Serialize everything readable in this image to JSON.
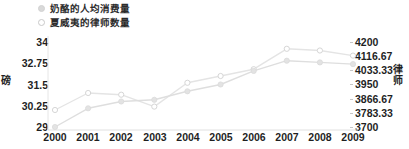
{
  "legend": {
    "items": [
      {
        "label": "奶酪的人均消费量",
        "marker": "filled-circle-icon",
        "color": "#d9d9d9"
      },
      {
        "label": "夏威夷的律师数量",
        "marker": "hollow-circle-icon",
        "color": "#c9c9c9"
      }
    ]
  },
  "axes": {
    "left_title": "磅",
    "right_title": "律师",
    "left_ticks": [
      "34",
      "32.75",
      "31.5",
      "30.25",
      "29"
    ],
    "right_ticks": [
      "4200",
      "4116.67",
      "4033.33",
      "3950",
      "3866.67",
      "3783.33",
      "3700"
    ],
    "x_ticks": [
      "2000",
      "2001",
      "2002",
      "2003",
      "2004",
      "2005",
      "2006",
      "2007",
      "2008",
      "2009"
    ]
  },
  "chart_data": {
    "type": "line",
    "title": "",
    "xlabel": "",
    "ylabel": "磅",
    "y2label": "律师",
    "x": [
      2000,
      2001,
      2002,
      2003,
      2004,
      2005,
      2006,
      2007,
      2008,
      2009
    ],
    "categories": [
      "2000",
      "2001",
      "2002",
      "2003",
      "2004",
      "2005",
      "2006",
      "2007",
      "2008",
      "2009"
    ],
    "grid": false,
    "legend_position": "top-left",
    "series": [
      {
        "name": "奶酪的人均消费量",
        "axis": "left",
        "unit": "磅",
        "color": "#dcdcdc",
        "marker": "filled-circle",
        "values": [
          29.0,
          30.1,
          30.5,
          30.6,
          31.1,
          31.5,
          32.3,
          32.9,
          32.8,
          32.7
        ],
        "ylim": [
          29,
          34
        ],
        "yticks": [
          29,
          30.25,
          31.5,
          32.75,
          34
        ]
      },
      {
        "name": "夏威夷的律师数量",
        "axis": "right",
        "unit": "律师",
        "color": "#e2e2e2",
        "marker": "hollow-circle",
        "values": [
          3800,
          3900,
          3890,
          3820,
          3960,
          4000,
          4040,
          4160,
          4150,
          4120
        ],
        "ylim": [
          3700,
          4200
        ],
        "yticks": [
          3700,
          3783.33,
          3866.67,
          3950,
          4033.33,
          4116.67,
          4200
        ]
      }
    ]
  }
}
